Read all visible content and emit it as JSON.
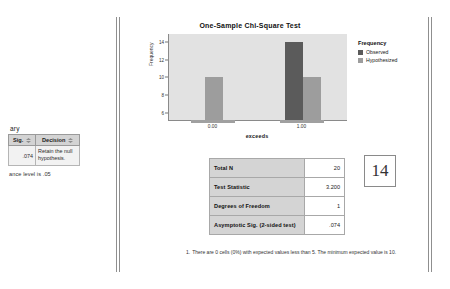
{
  "left_panel": {
    "title": "ary",
    "columns": [
      "Sig.",
      "Decision"
    ],
    "row": {
      "sig": ".074",
      "decision": "Retain the null hypothesis."
    },
    "footnote": "ance level is .05"
  },
  "chart_data": {
    "type": "bar",
    "title": "One-Sample Chi-Square Test",
    "xlabel": "exceeds",
    "ylabel": "Frequency",
    "categories": [
      "0.00",
      "1.00"
    ],
    "series": [
      {
        "name": "Observed",
        "values": [
          null,
          14
        ],
        "color": "#5b5b5b"
      },
      {
        "name": "Hypothesized",
        "values": [
          10,
          10
        ],
        "color": "#9d9d9d"
      }
    ],
    "ylim": [
      5.2,
      14.9
    ],
    "yticks": [
      "14",
      "12",
      "10",
      "8",
      "6"
    ],
    "ytick_values": [
      14,
      12,
      10,
      8,
      6
    ],
    "legend_title": "Frequency",
    "legend_position": "right",
    "grid": false
  },
  "results_table": {
    "rows": [
      {
        "label": "Total N",
        "value": "20"
      },
      {
        "label": "Test Statistic",
        "value": "3.200"
      },
      {
        "label": "Degrees of Freedom",
        "value": "1"
      },
      {
        "label": "Asymptotic Sig. (2-sided test)",
        "value": ".074"
      }
    ]
  },
  "footnote": {
    "index": "1.",
    "text": "There are 0 cells (0%) with expected values less than 5.  The minimum expected value is 10."
  },
  "page_number": "14"
}
